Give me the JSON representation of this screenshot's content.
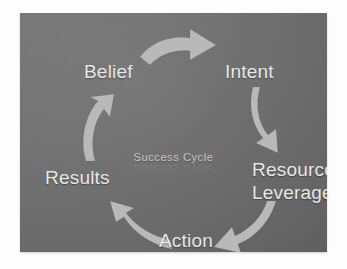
{
  "diagram": {
    "title": "Success Cycle",
    "title_reflection": "Success Cycle",
    "type": "cycle",
    "background_color": "#6e6e6e",
    "label_color": "#e8e8e8",
    "arrow_color": "#b9b9b9",
    "nodes": [
      {
        "id": "belief",
        "label": "Belief"
      },
      {
        "id": "intent",
        "label": "Intent"
      },
      {
        "id": "resource",
        "label": "Resource Leverage"
      },
      {
        "id": "action",
        "label": "Action"
      },
      {
        "id": "results",
        "label": "Results"
      }
    ],
    "arrows": [
      {
        "id": "belief-intent",
        "from": "Belief",
        "to": "Intent",
        "direction": "right"
      },
      {
        "id": "intent-resource",
        "from": "Intent",
        "to": "Resource Leverage",
        "direction": "down"
      },
      {
        "id": "resource-action",
        "from": "Resource Leverage",
        "to": "Action",
        "direction": "down-left"
      },
      {
        "id": "action-results",
        "from": "Action",
        "to": "Results",
        "direction": "up-left"
      },
      {
        "id": "results-belief",
        "from": "Results",
        "to": "Belief",
        "direction": "up"
      }
    ]
  }
}
